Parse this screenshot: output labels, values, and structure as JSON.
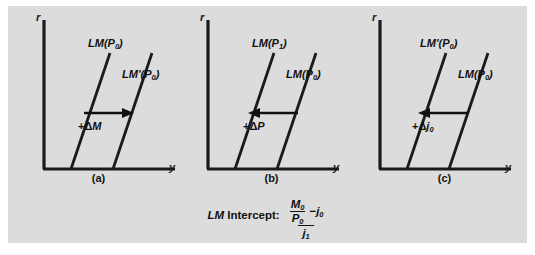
{
  "figure": {
    "background_color": "#dcdcdc",
    "line_color": "#1a1a1a",
    "panels": [
      {
        "id": "a",
        "caption": "(a)",
        "y_axis_label": "r",
        "x_axis_label": "y",
        "curve_upper_label": "LM(P",
        "curve_upper_sub": "0",
        "curve_upper_suffix": ")",
        "curve_lower_label": "LM'(P",
        "curve_lower_sub": "0",
        "curve_lower_suffix": ")",
        "shift_prefix": "+Δ",
        "shift_symbol": "M",
        "shift_sub": "",
        "arrow_direction": "right"
      },
      {
        "id": "b",
        "caption": "(b)",
        "y_axis_label": "r",
        "x_axis_label": "y",
        "curve_upper_label": "LM(P",
        "curve_upper_sub": "1",
        "curve_upper_suffix": ")",
        "curve_lower_label": "LM(P",
        "curve_lower_sub": "0",
        "curve_lower_suffix": ")",
        "shift_prefix": "+Δ",
        "shift_symbol": "P",
        "shift_sub": "",
        "arrow_direction": "left"
      },
      {
        "id": "c",
        "caption": "(c)",
        "y_axis_label": "r",
        "x_axis_label": "y",
        "curve_upper_label": "LM'(P",
        "curve_upper_sub": "0",
        "curve_upper_suffix": ")",
        "curve_lower_label": "LM(P",
        "curve_lower_sub": "0",
        "curve_lower_suffix": ")",
        "shift_prefix": "+Δ",
        "shift_symbol": "j",
        "shift_sub": "0",
        "arrow_direction": "left"
      }
    ],
    "intercept": {
      "label_lm": "LM",
      "label_text": " Intercept:",
      "numerator_money": "M",
      "numerator_money_sub": "0",
      "numerator_price": "P",
      "numerator_price_sub": "0",
      "numerator_minus": "−",
      "numerator_j": "j",
      "numerator_j_sub": "0",
      "denominator_j": "j",
      "denominator_j_sub": "1"
    }
  }
}
